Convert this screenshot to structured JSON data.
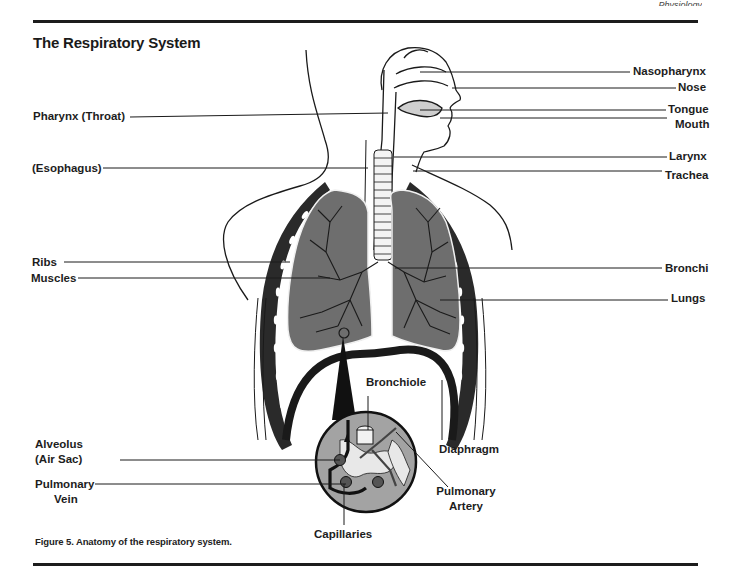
{
  "header": {
    "running_head_fragment": "Physiology"
  },
  "diagram": {
    "title": "The Respiratory System",
    "caption": "Figure 5. Anatomy of the respiratory system.",
    "labels_left": [
      {
        "id": "pharynx",
        "text": "Pharynx (Throat)"
      },
      {
        "id": "esophagus",
        "text": "(Esophagus)"
      },
      {
        "id": "ribs",
        "text": "Ribs"
      },
      {
        "id": "muscles",
        "text": "Muscles"
      },
      {
        "id": "alveolus",
        "text_line1": "Alveolus",
        "text_line2": "(Air Sac)"
      },
      {
        "id": "pulmonary-vein",
        "text_line1": "Pulmonary",
        "text_line2": "Vein"
      }
    ],
    "labels_right": [
      {
        "id": "nasopharynx",
        "text": "Nasopharynx"
      },
      {
        "id": "nose",
        "text": "Nose"
      },
      {
        "id": "tongue",
        "text": "Tongue"
      },
      {
        "id": "mouth",
        "text": "Mouth"
      },
      {
        "id": "larynx",
        "text": "Larynx"
      },
      {
        "id": "trachea",
        "text": "Trachea"
      },
      {
        "id": "bronchi",
        "text": "Bronchi"
      },
      {
        "id": "lungs",
        "text": "Lungs"
      }
    ],
    "labels_bottom": [
      {
        "id": "bronchiole",
        "text": "Bronchiole"
      },
      {
        "id": "diaphragm",
        "text": "Diaphragm"
      },
      {
        "id": "pulmonary-artery",
        "text_line1": "Pulmonary",
        "text_line2": "Artery"
      },
      {
        "id": "capillaries",
        "text": "Capillaries"
      }
    ],
    "colors": {
      "lung_fill": "#6e6e6e",
      "rib_band": "#2a2a2a",
      "outline": "#1a1a1a",
      "inset_fill": "#9a9a9a"
    }
  }
}
